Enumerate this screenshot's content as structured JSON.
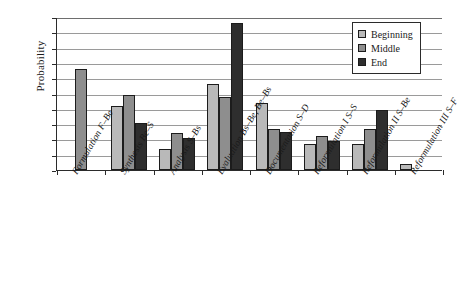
{
  "chart_data": {
    "type": "bar",
    "title": "",
    "xlabel": "",
    "ylabel": "Probability",
    "ylim": [
      0,
      1.0
    ],
    "grid": true,
    "legend_position": "top-right",
    "ytick_labels": [
      "1.0",
      "0.9",
      "0.8",
      "0.7",
      "0.6",
      "0.5",
      "0.4",
      "0.3",
      "0.2",
      "0.1",
      "0"
    ],
    "ytick_values": [
      1.0,
      0.9,
      0.8,
      0.7,
      0.6,
      0.5,
      0.4,
      0.3,
      0.2,
      0.1,
      0
    ],
    "categories": [
      "Formulation F–Be",
      "Synthesis Be–S",
      "Analysis S–Bs",
      "Evaluation Bs–Be, Be–Bs",
      "Documentation S–D",
      "Reformulation I S–S",
      "Reformulation II S–Be",
      "Reformulation III S–F"
    ],
    "series": [
      {
        "name": "Beginning",
        "color": "#b9b9b9",
        "values": [
          null,
          0.42,
          0.14,
          0.56,
          0.44,
          0.17,
          0.17,
          0.04
        ]
      },
      {
        "name": "Middle",
        "color": "#8e8e8e",
        "values": [
          0.66,
          0.49,
          0.24,
          0.48,
          0.27,
          0.22,
          0.27,
          null
        ]
      },
      {
        "name": "End",
        "color": "#2e2e2e",
        "values": [
          null,
          0.31,
          0.21,
          0.96,
          0.25,
          0.19,
          0.39,
          null
        ]
      }
    ]
  },
  "legend": {
    "items": [
      {
        "label": "Beginning"
      },
      {
        "label": "Middle"
      },
      {
        "label": "End"
      }
    ]
  }
}
